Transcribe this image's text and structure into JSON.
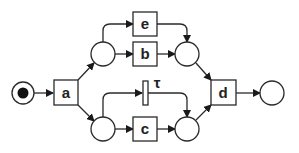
{
  "diagram": {
    "type": "petri-net",
    "colors": {
      "stroke": "#2a2a2a",
      "fill": "#ffffff",
      "token": "#111111"
    },
    "places": [
      {
        "id": "start",
        "cx": 23,
        "cy": 93,
        "r": 11,
        "token": true
      },
      {
        "id": "p1",
        "cx": 103,
        "cy": 54,
        "r": 12,
        "token": false
      },
      {
        "id": "p2",
        "cx": 103,
        "cy": 129,
        "r": 12,
        "token": false
      },
      {
        "id": "p3",
        "cx": 187,
        "cy": 54,
        "r": 12,
        "token": false
      },
      {
        "id": "p4",
        "cx": 187,
        "cy": 129,
        "r": 12,
        "token": false
      },
      {
        "id": "end",
        "cx": 272,
        "cy": 93,
        "r": 12,
        "token": false
      }
    ],
    "transitions": {
      "a": {
        "label": "a"
      },
      "e": {
        "label": "e"
      },
      "b": {
        "label": "b"
      },
      "tau": {
        "label": "τ"
      },
      "c": {
        "label": "c"
      },
      "d": {
        "label": "d"
      }
    }
  }
}
